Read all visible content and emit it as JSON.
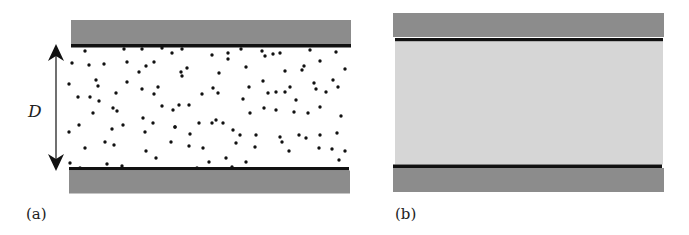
{
  "panels": [
    {
      "id": "a",
      "label": "(a)",
      "description": "Particles dispersed between two parallel plates",
      "dimension_label": "D",
      "colors": {
        "plate": "#8c8c8c",
        "surface_line": "#111111",
        "gap": "#ffffff",
        "particle": "#111111"
      }
    },
    {
      "id": "b",
      "label": "(b)",
      "description": "Continuous medium between two parallel plates",
      "colors": {
        "plate": "#8c8c8c",
        "surface_line": "#111111",
        "gap": "#d6d6d6"
      }
    }
  ]
}
